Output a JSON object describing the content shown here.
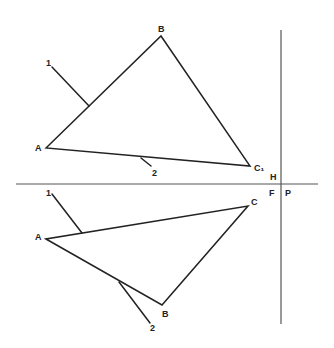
{
  "diagram": {
    "title": "",
    "colors": {
      "line": "#222222",
      "axis": "#555555",
      "background": "#ffffff"
    },
    "folding_lines": {
      "horizontal": {
        "x1": 16,
        "y1": 184,
        "x2": 318,
        "y2": 184
      },
      "vertical": {
        "x1": 281,
        "y1": 30,
        "x2": 281,
        "y2": 324
      },
      "labels": {
        "H": {
          "text": "H",
          "x": 270,
          "y": 180
        },
        "F": {
          "text": "F",
          "x": 269,
          "y": 196
        },
        "P": {
          "text": "P",
          "x": 285,
          "y": 196
        }
      }
    },
    "top_view": {
      "name": "horizontal projection",
      "vertices": {
        "A": {
          "x": 46,
          "y": 148,
          "label": "A",
          "lx": 35,
          "ly": 151
        },
        "B": {
          "x": 161,
          "y": 36,
          "label": "B",
          "lx": 158,
          "ly": 32
        },
        "C": {
          "x": 250,
          "y": 166,
          "label": "C₁",
          "lx": 254,
          "ly": 171
        }
      },
      "lines": [
        {
          "id": "1",
          "label": "1",
          "x1": 52,
          "y1": 67,
          "x2": 89,
          "y2": 106,
          "lx": 46,
          "ly": 66
        },
        {
          "id": "2",
          "label": "2",
          "x1": 141,
          "y1": 158,
          "x2": 151,
          "y2": 166,
          "lx": 152,
          "ly": 176
        }
      ]
    },
    "front_view": {
      "name": "frontal projection",
      "vertices": {
        "A": {
          "x": 46,
          "y": 239,
          "label": "A",
          "lx": 35,
          "ly": 240
        },
        "B": {
          "x": 162,
          "y": 305,
          "label": "B",
          "lx": 162,
          "ly": 317
        },
        "C": {
          "x": 248,
          "y": 206,
          "label": "C",
          "lx": 251,
          "ly": 205
        }
      },
      "lines": [
        {
          "id": "1",
          "label": "1",
          "x1": 52,
          "y1": 194,
          "x2": 82,
          "y2": 233,
          "lx": 46,
          "ly": 196
        },
        {
          "id": "2",
          "label": "2",
          "x1": 119,
          "y1": 282,
          "x2": 150,
          "y2": 323,
          "lx": 150,
          "ly": 331
        }
      ]
    }
  }
}
